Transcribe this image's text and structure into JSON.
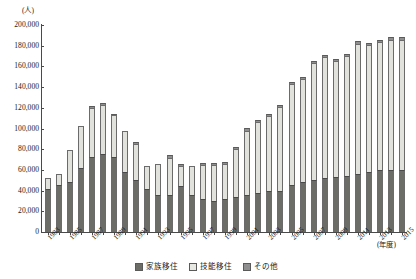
{
  "chart_data": {
    "type": "bar",
    "stacked": true,
    "title": "",
    "unit_label": "(人)",
    "xlabel": "(年度)",
    "ylabel": "",
    "ylim": [
      0,
      200000
    ],
    "ytick_step": 20000,
    "grid": false,
    "legend_position": "bottom",
    "ytick_labels": [
      "200,000",
      "180,000",
      "160,000",
      "140,000",
      "120,000",
      "100,000",
      "80,000",
      "60,000",
      "40,000",
      "20,000",
      "0"
    ],
    "ytick_values": [
      200000,
      180000,
      160000,
      140000,
      120000,
      100000,
      80000,
      60000,
      40000,
      20000,
      0
    ],
    "categories": [
      "1983",
      "1984",
      "1985",
      "1986",
      "1987",
      "1988",
      "1989",
      "1990",
      "1991",
      "1992",
      "1993",
      "1994",
      "1995",
      "1996",
      "1997",
      "1998",
      "1999",
      "2000",
      "2001",
      "2002",
      "2003",
      "2004",
      "2005",
      "2006",
      "2007",
      "2008",
      "2009",
      "2010",
      "2011",
      "2012",
      "2013",
      "2014",
      "2015"
    ],
    "xtick_labels": [
      "1983",
      "",
      "1985",
      "",
      "1987",
      "",
      "1989",
      "",
      "1991",
      "",
      "1993",
      "",
      "1995",
      "",
      "1997",
      "",
      "1999",
      "",
      "2001",
      "",
      "2003",
      "",
      "2005",
      "",
      "2007",
      "",
      "2009",
      "",
      "2011",
      "",
      "2013",
      "",
      "2015"
    ],
    "series": [
      {
        "name": "家族移住",
        "color": "#6d6d68",
        "values": [
          42000,
          45000,
          48000,
          62000,
          72000,
          75000,
          72000,
          58000,
          50000,
          42000,
          36000,
          36000,
          44000,
          36000,
          32000,
          30000,
          32000,
          34000,
          36000,
          38000,
          40000,
          40000,
          45000,
          48000,
          50000,
          52000,
          53000,
          54000,
          56000,
          58000,
          60000,
          60000,
          60000
        ]
      },
      {
        "name": "技能移住",
        "color": "#e2e2dd",
        "values": [
          10000,
          11000,
          31000,
          40000,
          48000,
          48000,
          41000,
          40000,
          35000,
          22000,
          30000,
          36000,
          20000,
          28000,
          33000,
          35000,
          34000,
          46000,
          62000,
          68000,
          72000,
          81000,
          98000,
          100000,
          113000,
          117000,
          112000,
          116000,
          126000,
          123000,
          124000,
          126000,
          126000
        ]
      },
      {
        "name": "その他",
        "color": "#8f8f8f",
        "values": [
          0,
          0,
          0,
          0,
          1500,
          1500,
          1500,
          0,
          2000,
          0,
          0,
          2000,
          1500,
          0,
          2000,
          1500,
          1500,
          2000,
          3000,
          2000,
          2000,
          2000,
          2000,
          2000,
          2000,
          2000,
          2000,
          2000,
          3000,
          2000,
          2000,
          2000,
          2000
        ]
      }
    ],
    "totals": [
      52000,
      56000,
      79000,
      102000,
      121500,
      124500,
      114500,
      98000,
      87000,
      64000,
      66000,
      74000,
      65500,
      64000,
      67000,
      66500,
      67500,
      82000,
      101000,
      108000,
      114000,
      123000,
      145000,
      150000,
      165000,
      171000,
      167000,
      172000,
      185000,
      183000,
      186000,
      188000,
      188000
    ]
  },
  "legend": {
    "items": [
      {
        "label": "家族移住",
        "swatch": "sw-family"
      },
      {
        "label": "技能移住",
        "swatch": "sw-skill"
      },
      {
        "label": "その他",
        "swatch": "sw-other"
      }
    ]
  }
}
